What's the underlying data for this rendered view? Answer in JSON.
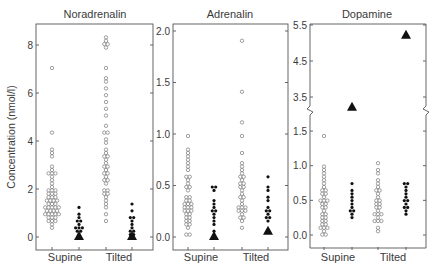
{
  "figure": {
    "ylabel": "Concentration (nmol/l)"
  },
  "chart_data": [
    {
      "type": "scatter",
      "subtype": "dot-strip-plot",
      "title": "Noradrenalin",
      "xlabel": "",
      "ylabel": "Concentration (nmol/l)",
      "categories": [
        "Supine",
        "Tilted"
      ],
      "yticks": [
        "0",
        "2",
        "4",
        "6",
        "8"
      ],
      "ylim": [
        -0.5,
        8.8
      ],
      "series": [
        {
          "name": "Supine (open circles, reference group)",
          "marker": "open-circle",
          "values": [
            7.1,
            4.3,
            3.7,
            3.5,
            3.3,
            3.0,
            2.8,
            2.7,
            2.6,
            2.6,
            2.5,
            2.3,
            2.2,
            2.1,
            2.0,
            1.95,
            1.9,
            1.85,
            1.8,
            1.75,
            1.7,
            1.65,
            1.6,
            1.55,
            1.5,
            1.5,
            1.45,
            1.4,
            1.4,
            1.35,
            1.3,
            1.3,
            1.25,
            1.2,
            1.2,
            1.15,
            1.1,
            1.1,
            1.05,
            1.0,
            1.0,
            0.95,
            0.9,
            0.9,
            0.85,
            0.8,
            0.75,
            0.7,
            0.65,
            0.6,
            0.5,
            0.4
          ]
        },
        {
          "name": "Supine (filled circles, patient group)",
          "marker": "filled-circle",
          "values": [
            1.2,
            1.0,
            0.85,
            0.7,
            0.6,
            0.5,
            0.45,
            0.4,
            0.35,
            0.3,
            0.2,
            0.1
          ]
        },
        {
          "name": "Supine (triangle)",
          "marker": "filled-triangle",
          "values": [
            0.0
          ]
        },
        {
          "name": "Tilted (open circles, reference group)",
          "marker": "open-circle",
          "values": [
            8.3,
            8.2,
            8.1,
            8.0,
            7.9,
            7.1,
            6.6,
            6.5,
            6.2,
            5.9,
            5.6,
            5.3,
            5.0,
            4.7,
            4.4,
            4.3,
            4.1,
            3.9,
            3.7,
            3.5,
            3.4,
            3.3,
            3.2,
            3.1,
            3.0,
            2.9,
            2.8,
            2.7,
            2.6,
            2.5,
            2.4,
            2.3,
            2.2,
            2.0,
            1.9,
            1.8,
            1.75,
            1.6,
            1.45,
            1.35,
            1.2,
            1.0,
            0.65
          ]
        },
        {
          "name": "Tilted (filled circles, patient group)",
          "marker": "filled-circle",
          "values": [
            1.35,
            1.1,
            0.85,
            0.75,
            0.6,
            0.5,
            0.4,
            0.3,
            0.25,
            0.15,
            0.1
          ]
        },
        {
          "name": "Tilted (triangle)",
          "marker": "filled-triangle",
          "values": [
            0.0
          ]
        }
      ]
    },
    {
      "type": "scatter",
      "subtype": "dot-strip-plot",
      "title": "Adrenalin",
      "xlabel": "",
      "ylabel": "Concentration (nmol/l)",
      "categories": [
        "Supine",
        "Tilted"
      ],
      "yticks": [
        "0.0",
        "0.5",
        "1.0",
        "1.5",
        "2.0"
      ],
      "ylim": [
        -0.12,
        2.07
      ],
      "series": [
        {
          "name": "Supine (open circles, reference group)",
          "marker": "open-circle",
          "values": [
            0.98,
            0.85,
            0.8,
            0.77,
            0.74,
            0.71,
            0.68,
            0.64,
            0.6,
            0.57,
            0.55,
            0.53,
            0.5,
            0.47,
            0.44,
            0.4,
            0.38,
            0.36,
            0.34,
            0.33,
            0.32,
            0.31,
            0.3,
            0.29,
            0.28,
            0.27,
            0.26,
            0.25,
            0.23,
            0.21,
            0.2,
            0.18,
            0.17,
            0.15,
            0.13,
            0.11,
            0.09,
            0.03,
            0.02
          ]
        },
        {
          "name": "Supine (filled circles, patient group)",
          "marker": "filled-circle",
          "values": [
            0.5,
            0.47,
            0.44,
            0.35,
            0.31,
            0.28,
            0.27,
            0.25,
            0.22,
            0.19,
            0.16,
            0.13,
            0.07
          ]
        },
        {
          "name": "Supine (triangle)",
          "marker": "filled-triangle",
          "values": [
            0.0
          ]
        },
        {
          "name": "Tilted (open circles, reference group)",
          "marker": "open-circle",
          "values": [
            1.92,
            1.4,
            1.1,
            0.97,
            0.82,
            0.72,
            0.68,
            0.64,
            0.61,
            0.59,
            0.57,
            0.55,
            0.53,
            0.51,
            0.49,
            0.47,
            0.45,
            0.42,
            0.4,
            0.37,
            0.34,
            0.32,
            0.3,
            0.29,
            0.28,
            0.27,
            0.25,
            0.24,
            0.22,
            0.2,
            0.18,
            0.16,
            0.09
          ]
        },
        {
          "name": "Tilted (filled circles, patient group)",
          "marker": "filled-circle",
          "values": [
            0.57,
            0.48,
            0.45,
            0.37,
            0.34,
            0.29,
            0.26,
            0.24,
            0.22,
            0.2,
            0.18,
            0.15
          ]
        },
        {
          "name": "Tilted (triangle)",
          "marker": "filled-triangle",
          "values": [
            0.05
          ]
        }
      ]
    },
    {
      "type": "scatter",
      "subtype": "dot-strip-plot",
      "title": "Dopamine",
      "xlabel": "",
      "ylabel": "Concentration (nmol/l)",
      "categories": [
        "Supine",
        "Tilted"
      ],
      "yticks": [
        "0.0",
        "0.5",
        "1.0",
        "1.5",
        "3.5",
        "4.5",
        "5.5"
      ],
      "axis_break": "between 1.5 and 3.5",
      "ylim": [
        -0.2,
        5.5
      ],
      "series": [
        {
          "name": "Supine (open circles, reference group)",
          "marker": "open-circle",
          "values": [
            1.45,
            1.0,
            0.95,
            0.9,
            0.85,
            0.8,
            0.75,
            0.68,
            0.65,
            0.62,
            0.6,
            0.57,
            0.55,
            0.52,
            0.5,
            0.48,
            0.45,
            0.43,
            0.4,
            0.38,
            0.35,
            0.32,
            0.3,
            0.27,
            0.25,
            0.22,
            0.2,
            0.17,
            0.15,
            0.12,
            0.1,
            0.08,
            0.05,
            0.03,
            0.01
          ]
        },
        {
          "name": "Supine (filled circles, patient group)",
          "marker": "filled-circle",
          "values": [
            0.72,
            0.66,
            0.61,
            0.56,
            0.51,
            0.46,
            0.41,
            0.37,
            0.36,
            0.3,
            0.25
          ]
        },
        {
          "name": "Supine (triangle)",
          "marker": "filled-triangle",
          "values": [
            3.2
          ]
        },
        {
          "name": "Tilted (open circles, reference group)",
          "marker": "open-circle",
          "values": [
            1.05,
            0.95,
            0.88,
            0.8,
            0.74,
            0.7,
            0.66,
            0.62,
            0.58,
            0.55,
            0.52,
            0.49,
            0.46,
            0.43,
            0.4,
            0.38,
            0.35,
            0.32,
            0.3,
            0.28,
            0.25,
            0.22,
            0.2,
            0.18,
            0.1,
            0.06
          ]
        },
        {
          "name": "Tilted (filled circles, patient group)",
          "marker": "filled-circle",
          "values": [
            0.76,
            0.72,
            0.68,
            0.64,
            0.6,
            0.56,
            0.52,
            0.48,
            0.44,
            0.4,
            0.38,
            0.33,
            0.28
          ]
        },
        {
          "name": "Tilted (triangle)",
          "marker": "filled-triangle",
          "values": [
            5.2
          ]
        }
      ]
    }
  ]
}
